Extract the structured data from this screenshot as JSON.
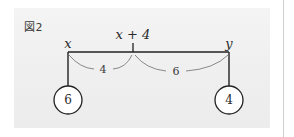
{
  "figure": {
    "label": "図2"
  },
  "diagram": {
    "type": "lever-balance",
    "beam": {
      "left_label": "x",
      "fulcrum_label": "x + 4",
      "right_label": "y"
    },
    "distances": [
      {
        "name": "left-distance",
        "value": "4"
      },
      {
        "name": "right-distance",
        "value": "6"
      }
    ],
    "weights": [
      {
        "name": "left-weight",
        "value": "6"
      },
      {
        "name": "right-weight",
        "value": "4"
      }
    ]
  },
  "colors": {
    "panel_background": "#f0f0f0",
    "page_background": "#ffffff",
    "stroke": "#222222",
    "brace_stroke": "#7d7d7d",
    "text": "#2a2a2a",
    "rule": "#cfcfcf"
  }
}
